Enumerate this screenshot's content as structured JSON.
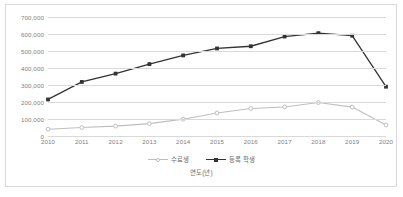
{
  "chart_data": {
    "type": "line",
    "title": "",
    "xlabel": "연도(년)",
    "ylabel": "",
    "categories": [
      "2010",
      "2011",
      "2012",
      "2013",
      "2014",
      "2015",
      "2016",
      "2017",
      "2018",
      "2019",
      "2020"
    ],
    "ylim": [
      0,
      700000
    ],
    "yticks": [
      "0",
      "100,000",
      "200,000",
      "300,000",
      "400,000",
      "500,000",
      "600,000",
      "700,000"
    ],
    "ytick_values": [
      0,
      100000,
      200000,
      300000,
      400000,
      500000,
      600000,
      700000
    ],
    "grid": true,
    "legend_position": "bottom",
    "series": [
      {
        "name": "수료생",
        "color": "#bfbfbf",
        "marker": "circle",
        "values": [
          40000,
          50000,
          58000,
          73000,
          99000,
          135000,
          162000,
          171000,
          197000,
          170000,
          65000
        ]
      },
      {
        "name": "등록 학생",
        "color": "#333333",
        "marker": "square",
        "values": [
          215000,
          318000,
          367000,
          423000,
          474000,
          515000,
          528000,
          585000,
          605000,
          590000,
          290000
        ]
      }
    ]
  },
  "colors": {
    "border": "#d9d9d9",
    "gridline": "#d9d9d9",
    "tick_text": "#7f7f7f",
    "legend_text": "#6d6d6d",
    "background": "#ffffff"
  }
}
